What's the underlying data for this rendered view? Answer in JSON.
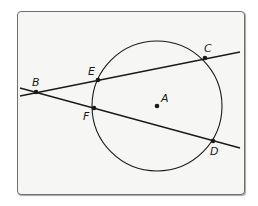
{
  "figure": {
    "colors": {
      "background": "#f6f6f4",
      "frame_border": "#6f6f6f",
      "stroke": "#1a1a1a"
    },
    "circle": {
      "center_label": "A",
      "cx": 157,
      "cy": 106,
      "r": 65
    },
    "points": [
      {
        "label": "A",
        "x": 157,
        "y": 106,
        "label_dx": 4,
        "label_dy": -4
      },
      {
        "label": "B",
        "x": 36,
        "y": 92,
        "label_dx": -4,
        "label_dy": -6
      },
      {
        "label": "C",
        "x": 205,
        "y": 58,
        "label_dx": -1,
        "label_dy": -6
      },
      {
        "label": "D",
        "x": 213,
        "y": 141,
        "label_dx": -3,
        "label_dy": 14
      },
      {
        "label": "E",
        "x": 98,
        "y": 80,
        "label_dx": -10,
        "label_dy": -5
      },
      {
        "label": "F",
        "x": 94,
        "y": 108,
        "label_dx": -11,
        "label_dy": 12
      }
    ],
    "lines": [
      {
        "name": "secant-BEC",
        "x1": 20,
        "y1": 96,
        "x2": 240,
        "y2": 52
      },
      {
        "name": "secant-BFD",
        "x1": 20,
        "y1": 88,
        "x2": 240,
        "y2": 148
      }
    ]
  }
}
